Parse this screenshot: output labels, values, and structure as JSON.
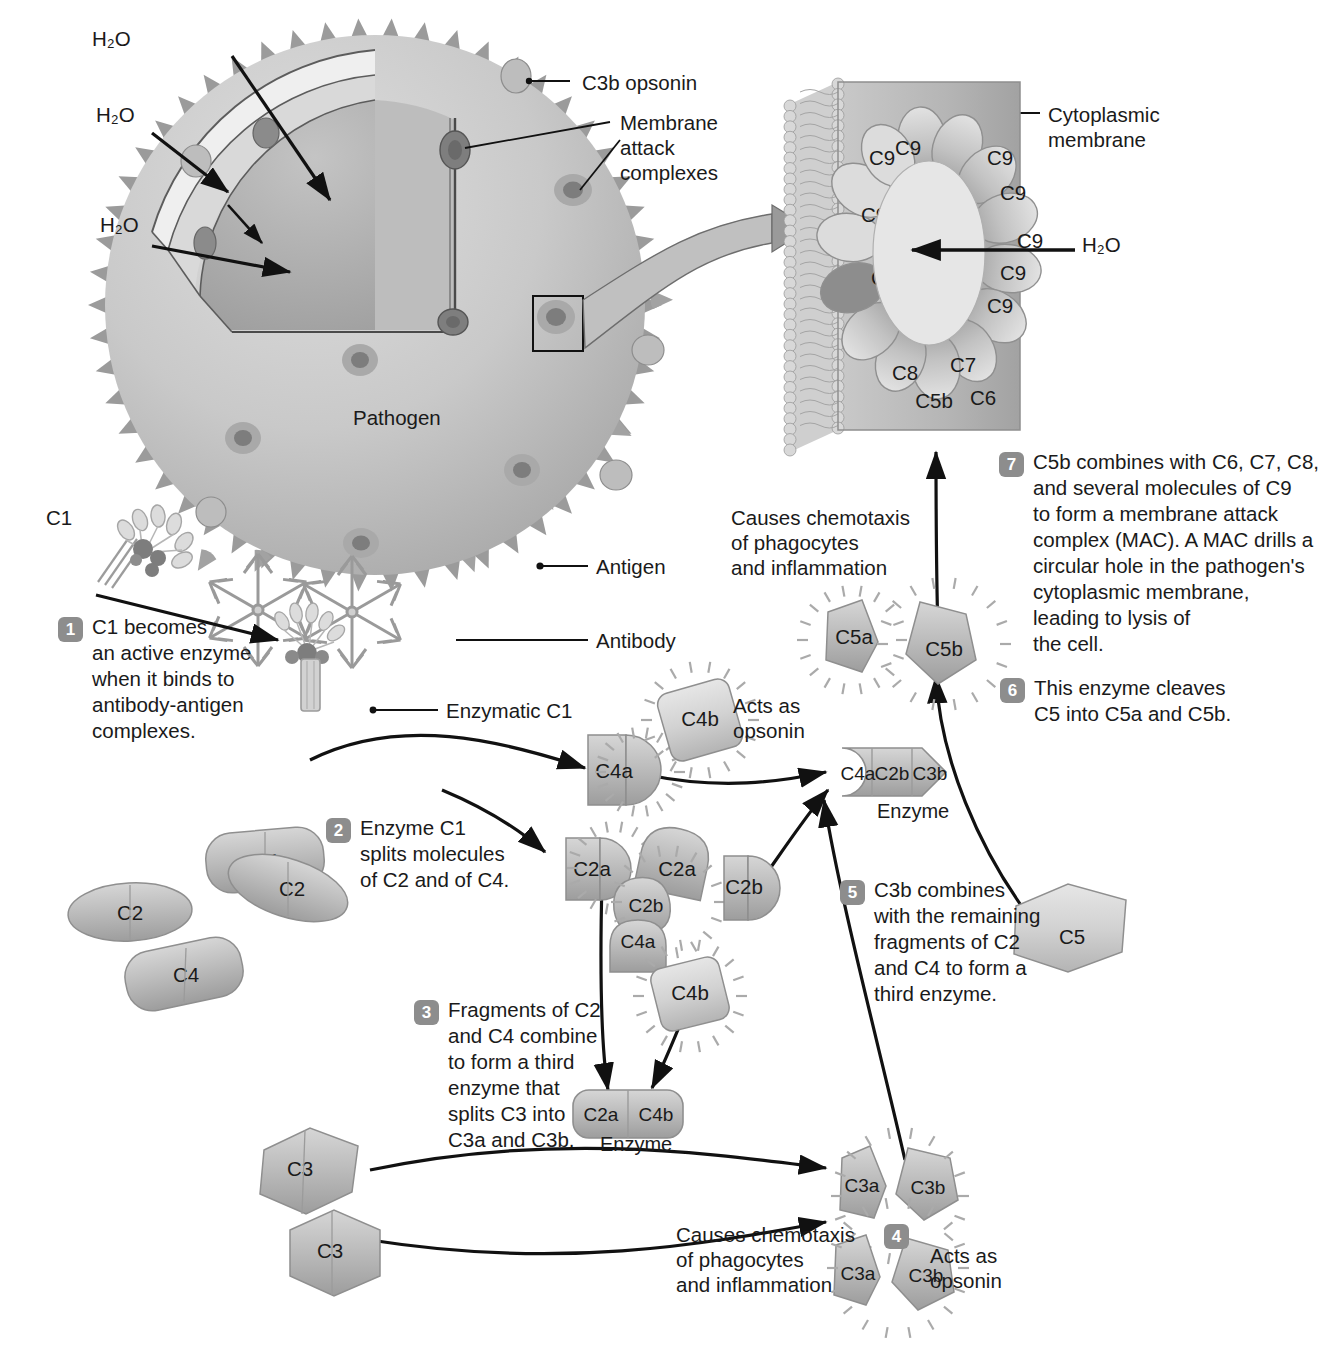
{
  "diagram": {
    "labels": {
      "h2o_1": "H₂O",
      "h2o_2": "H₂O",
      "h2o_3": "H₂O",
      "h2o_mac": "H₂O",
      "c3b_opsonin": "C3b opsonin",
      "membrane_attack_complexes": "Membrane\nattack\ncomplexes",
      "pathogen": "Pathogen",
      "antigen": "Antigen",
      "antibody": "Antibody",
      "enzymatic_c1": "Enzymatic C1",
      "cytoplasmic_membrane": "Cytoplasmic\nmembrane",
      "c1": "C1",
      "acts_as_opsonin_c4b": "Acts as\nopsonin",
      "acts_as_opsonin_c3b": "Acts as\nopsonin",
      "chemotaxis_c5a": "Causes chemotaxis\nof phagocytes\nand inflammation",
      "chemotaxis_c3a": "Causes chemotaxis\nof phagocytes\nand inflammation",
      "enzyme_c2a_c4b": "Enzyme",
      "enzyme_c4a_c2b_c3b": "Enzyme"
    },
    "steps": [
      {
        "number": "1",
        "text": "C1 becomes\nan active enzyme\nwhen it binds to\nantibody-antigen\ncomplexes."
      },
      {
        "number": "2",
        "text": "Enzyme C1\nsplits molecules\nof C2 and of C4."
      },
      {
        "number": "3",
        "text": "Fragments of C2\nand C4 combine\nto form a third\nenzyme that\nsplits C3 into\nC3a and C3b."
      },
      {
        "number": "4",
        "text": ""
      },
      {
        "number": "5",
        "text": "C3b combines\nwith the remaining\nfragments of C2\nand C4 to form a\nthird enzyme."
      },
      {
        "number": "6",
        "text": "This enzyme cleaves\nC5 into C5a and C5b."
      },
      {
        "number": "7",
        "text": "C5b combines with C6, C7, C8,\nand several molecules of C9\nto form a membrane attack\ncomplex (MAC). A MAC drills a\ncircular hole in the pathogen's\ncytoplasmic membrane,\nleading to lysis of\nthe cell."
      }
    ],
    "mac_ring": [
      {
        "name": "C9"
      },
      {
        "name": "C9"
      },
      {
        "name": "C9"
      },
      {
        "name": "C9"
      },
      {
        "name": "C9"
      },
      {
        "name": "C9"
      },
      {
        "name": "C9"
      },
      {
        "name": "C9"
      },
      {
        "name": "C9"
      },
      {
        "name": "C9"
      },
      {
        "name": "C8"
      },
      {
        "name": "C7"
      },
      {
        "name": "C6"
      },
      {
        "name": "C5b"
      }
    ],
    "molecules": {
      "c4_top": "C4",
      "c4_bottom": "C4",
      "c2_left": "C2",
      "c2_right": "C2",
      "c4a_1": "C4a",
      "c4b_1": "C4b",
      "c2a_1": "C2a",
      "c2a_2": "C2a",
      "c2b_1": "C2b",
      "c2b_2": "C2b",
      "c4a_2": "C4a",
      "c4b_2": "C4b",
      "enzyme_left_parts": [
        "C2a",
        "C4b"
      ],
      "enzyme_right_parts": [
        "C4a",
        "C2b",
        "C3b"
      ],
      "c3_top": "C3",
      "c3_bottom": "C3",
      "c3a_top": "C3a",
      "c3b_top": "C3b",
      "c3a_bottom": "C3a",
      "c3b_bottom": "C3b",
      "c5": "C5",
      "c5a": "C5a",
      "c5b": "C5b"
    },
    "colors": {
      "body_fill": "#c6c6c6",
      "spike_fill": "#9b9b9b",
      "molecule_fill": "#b8b8b8",
      "molecule_light": "#d8d8d8",
      "molecule_dark": "#8d8d8d",
      "badge_bg": "#8d8d8d",
      "line": "#111111",
      "text": "#1a1a1a",
      "membrane_fill": "#bdbdbd"
    }
  }
}
